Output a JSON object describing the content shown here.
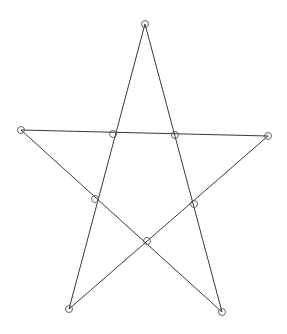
{
  "diagram": {
    "type": "pentagram",
    "stroke_color": "#3a3a3a",
    "point_color": "#555555",
    "background": "#ffffff",
    "outer_points": [
      {
        "id": "top",
        "x": 145,
        "y": 24
      },
      {
        "id": "left",
        "x": 21,
        "y": 130
      },
      {
        "id": "right",
        "x": 268,
        "y": 136
      },
      {
        "id": "bottom-left",
        "x": 69,
        "y": 309
      },
      {
        "id": "bottom-right",
        "x": 222,
        "y": 312
      }
    ],
    "inner_points": [
      {
        "id": "inner-top-left",
        "x": 113,
        "y": 134
      },
      {
        "id": "inner-top-right",
        "x": 175,
        "y": 135
      },
      {
        "id": "inner-left",
        "x": 95,
        "y": 199
      },
      {
        "id": "inner-right",
        "x": 194,
        "y": 204
      },
      {
        "id": "inner-bottom",
        "x": 147,
        "y": 241
      }
    ],
    "edges": [
      [
        "top",
        "bottom-left"
      ],
      [
        "top",
        "bottom-right"
      ],
      [
        "left",
        "right"
      ],
      [
        "left",
        "bottom-right"
      ],
      [
        "right",
        "bottom-left"
      ]
    ]
  }
}
